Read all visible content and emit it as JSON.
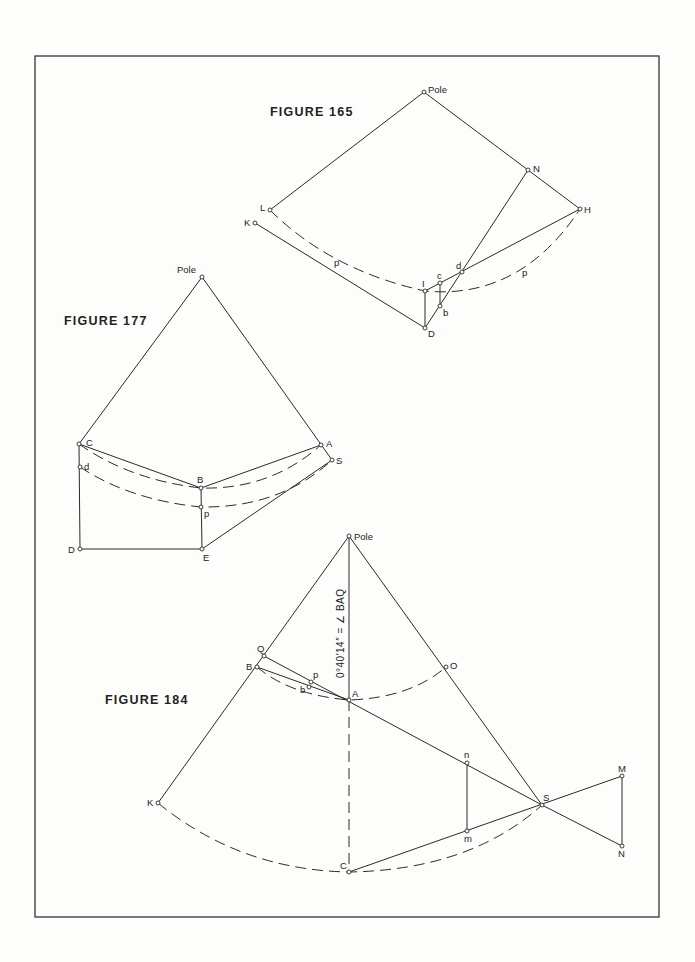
{
  "figures": {
    "fig165": {
      "title": "FIGURE 165",
      "labels": {
        "pole": "Pole",
        "N": "N",
        "H": "H",
        "L": "L",
        "K": "K",
        "p1": "p",
        "p2": "p",
        "I": "I",
        "c": "c",
        "d": "d",
        "b": "b",
        "D": "D"
      }
    },
    "fig177": {
      "title": "FIGURE 177",
      "labels": {
        "pole": "Pole",
        "C": "C",
        "A": "A",
        "S": "S",
        "d": "d",
        "B": "B",
        "p": "p",
        "D": "D",
        "E": "E"
      }
    },
    "fig184": {
      "title": "FIGURE 184",
      "angle_note": "0°40′14″ = ∠ BAQ",
      "labels": {
        "pole": "Pole",
        "Q": "Q",
        "B": "B",
        "p": "p",
        "b": "b",
        "A": "A",
        "O": "O",
        "n": "n",
        "m": "m",
        "S": "S",
        "M": "M",
        "N": "N",
        "K": "K",
        "C": "C"
      }
    }
  },
  "colors": {
    "ink": "#2a2a2a",
    "paper": "#fdfdfc",
    "frame": "#333333"
  }
}
